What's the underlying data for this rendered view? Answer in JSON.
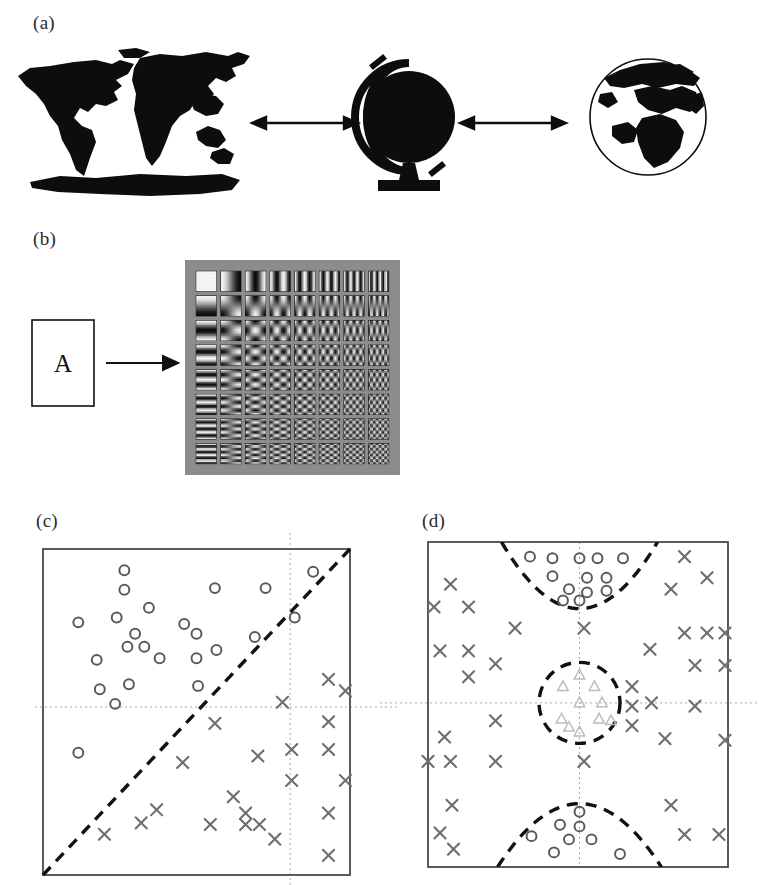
{
  "figure": {
    "background": "#ffffff",
    "ink": "#111111",
    "marker_gray": "#6e6e6e",
    "triangle_gray": "#b9b9b9",
    "grid_gray": "#aaaaaa",
    "dct_background": "#8c8c8c"
  },
  "panels": [
    {
      "id": "a",
      "label": "(a)",
      "kind": "illustration",
      "caption_text": "(a)",
      "items": [
        {
          "name": "world-map",
          "description": "flat world map silhouette with Antarctica strip"
        },
        {
          "name": "globe-on-stand",
          "description": "solid black globe with meridian ring and pedestal stand"
        },
        {
          "name": "earth-sphere",
          "description": "spherical Earth view centred on Europe and Africa"
        },
        {
          "name": "arrow-left",
          "description": "double-headed arrow between map and globe"
        },
        {
          "name": "arrow-right",
          "description": "double-headed arrow between globe and sphere"
        }
      ]
    },
    {
      "id": "b",
      "label": "(b)",
      "kind": "illustration",
      "source_symbol": "A",
      "items": [
        {
          "name": "letter-box",
          "description": "thin rectangle containing the letter A"
        },
        {
          "name": "transform-arrow",
          "description": "single-headed arrow pointing right"
        },
        {
          "name": "dct-basis-grid",
          "description": "8 by 8 grid of discrete cosine transform basis patches on grey field",
          "rows": 8,
          "cols": 8
        }
      ]
    },
    {
      "id": "c",
      "label": "(c)",
      "kind": "scatter"
    },
    {
      "id": "d",
      "label": "(d)",
      "kind": "scatter"
    }
  ],
  "chart_data": [
    {
      "panel": "c",
      "type": "scatter",
      "title": "(c)",
      "xlabel": "",
      "ylabel": "",
      "xlim": [
        0,
        1
      ],
      "ylim": [
        0,
        1
      ],
      "grid": true,
      "gridlines": {
        "vertical_x": 0.805,
        "horizontal_y": 0.515
      },
      "boundaries": [
        {
          "name": "linear-decision-boundary",
          "style": "dashed",
          "shape": "line",
          "from": [
            0.0,
            0.0
          ],
          "to": [
            1.0,
            1.0
          ]
        }
      ],
      "series": [
        {
          "name": "class-circle",
          "marker": "o",
          "color": "#5a5a5a",
          "points": [
            [
              0.265,
              0.935
            ],
            [
              0.265,
              0.875
            ],
            [
              0.345,
              0.82
            ],
            [
              0.56,
              0.88
            ],
            [
              0.725,
              0.88
            ],
            [
              0.88,
              0.93
            ],
            [
              0.115,
              0.775
            ],
            [
              0.24,
              0.79
            ],
            [
              0.3,
              0.74
            ],
            [
              0.46,
              0.77
            ],
            [
              0.82,
              0.79
            ],
            [
              0.275,
              0.7
            ],
            [
              0.33,
              0.7
            ],
            [
              0.5,
              0.74
            ],
            [
              0.69,
              0.73
            ],
            [
              0.175,
              0.66
            ],
            [
              0.38,
              0.665
            ],
            [
              0.5,
              0.665
            ],
            [
              0.565,
              0.69
            ],
            [
              0.185,
              0.57
            ],
            [
              0.28,
              0.585
            ],
            [
              0.505,
              0.58
            ],
            [
              0.235,
              0.525
            ],
            [
              0.115,
              0.375
            ]
          ]
        },
        {
          "name": "class-cross",
          "marker": "x",
          "color": "#6e6e6e",
          "points": [
            [
              0.93,
              0.6
            ],
            [
              0.985,
              0.565
            ],
            [
              0.78,
              0.53
            ],
            [
              0.93,
              0.47
            ],
            [
              0.56,
              0.465
            ],
            [
              0.81,
              0.385
            ],
            [
              0.93,
              0.385
            ],
            [
              0.7,
              0.365
            ],
            [
              0.455,
              0.345
            ],
            [
              0.81,
              0.29
            ],
            [
              0.985,
              0.29
            ],
            [
              0.62,
              0.24
            ],
            [
              0.93,
              0.19
            ],
            [
              0.37,
              0.2
            ],
            [
              0.66,
              0.19
            ],
            [
              0.32,
              0.16
            ],
            [
              0.545,
              0.155
            ],
            [
              0.66,
              0.155
            ],
            [
              0.705,
              0.155
            ],
            [
              0.2,
              0.125
            ],
            [
              0.755,
              0.11
            ],
            [
              0.93,
              0.06
            ]
          ]
        }
      ]
    },
    {
      "panel": "d",
      "type": "scatter",
      "title": "(d)",
      "xlabel": "",
      "ylabel": "",
      "xlim": [
        0,
        1
      ],
      "ylim": [
        0,
        1
      ],
      "grid": true,
      "gridlines": {
        "vertical_x": 0.505,
        "horizontal_y": 0.505
      },
      "boundaries": [
        {
          "name": "upper-parabola-boundary",
          "style": "dashed",
          "shape": "parabola-opening-up",
          "vertex": [
            0.505,
            0.795
          ],
          "half_width": 0.2,
          "top_y": 1.0
        },
        {
          "name": "centre-circle-boundary",
          "style": "dashed",
          "shape": "circle",
          "centre": [
            0.505,
            0.505
          ],
          "radius": 0.135
        },
        {
          "name": "lower-arch-boundary",
          "style": "dashed",
          "shape": "parabola-opening-down",
          "vertex": [
            0.505,
            0.195
          ],
          "half_width": 0.21,
          "bottom_y": 0.0
        }
      ],
      "series": [
        {
          "name": "class-circle",
          "marker": "o",
          "color": "#5a5a5a",
          "points": [
            [
              0.34,
              0.955
            ],
            [
              0.415,
              0.95
            ],
            [
              0.505,
              0.95
            ],
            [
              0.565,
              0.95
            ],
            [
              0.65,
              0.95
            ],
            [
              0.415,
              0.895
            ],
            [
              0.53,
              0.89
            ],
            [
              0.595,
              0.89
            ],
            [
              0.47,
              0.855
            ],
            [
              0.53,
              0.845
            ],
            [
              0.595,
              0.85
            ],
            [
              0.45,
              0.82
            ],
            [
              0.505,
              0.82
            ],
            [
              0.505,
              0.17
            ],
            [
              0.44,
              0.13
            ],
            [
              0.505,
              0.125
            ],
            [
              0.345,
              0.095
            ],
            [
              0.47,
              0.085
            ],
            [
              0.545,
              0.085
            ],
            [
              0.42,
              0.045
            ],
            [
              0.64,
              0.04
            ]
          ]
        },
        {
          "name": "class-triangle",
          "marker": "^",
          "color": "#bdbdbd",
          "points": [
            [
              0.505,
              0.59
            ],
            [
              0.45,
              0.555
            ],
            [
              0.555,
              0.555
            ],
            [
              0.505,
              0.505
            ],
            [
              0.58,
              0.505
            ],
            [
              0.445,
              0.455
            ],
            [
              0.57,
              0.455
            ],
            [
              0.61,
              0.45
            ],
            [
              0.47,
              0.43
            ],
            [
              0.505,
              0.415
            ]
          ]
        },
        {
          "name": "class-cross",
          "marker": "x",
          "color": "#6e6e6e",
          "points": [
            [
              0.855,
              0.955
            ],
            [
              0.075,
              0.87
            ],
            [
              0.93,
              0.89
            ],
            [
              0.81,
              0.855
            ],
            [
              0.02,
              0.8
            ],
            [
              0.135,
              0.8
            ],
            [
              0.29,
              0.735
            ],
            [
              0.52,
              0.735
            ],
            [
              0.855,
              0.72
            ],
            [
              0.93,
              0.72
            ],
            [
              0.99,
              0.72
            ],
            [
              0.04,
              0.665
            ],
            [
              0.135,
              0.665
            ],
            [
              0.74,
              0.67
            ],
            [
              0.225,
              0.625
            ],
            [
              0.89,
              0.62
            ],
            [
              0.99,
              0.62
            ],
            [
              0.135,
              0.585
            ],
            [
              0.68,
              0.555
            ],
            [
              0.745,
              0.505
            ],
            [
              0.68,
              0.495
            ],
            [
              0.225,
              0.45
            ],
            [
              0.89,
              0.495
            ],
            [
              0.68,
              0.435
            ],
            [
              0.055,
              0.4
            ],
            [
              0.79,
              0.395
            ],
            [
              0.99,
              0.39
            ],
            [
              0.0,
              0.325
            ],
            [
              0.075,
              0.325
            ],
            [
              0.225,
              0.325
            ],
            [
              0.52,
              0.325
            ],
            [
              0.08,
              0.19
            ],
            [
              0.81,
              0.19
            ],
            [
              0.04,
              0.105
            ],
            [
              0.855,
              0.1
            ],
            [
              0.97,
              0.1
            ],
            [
              0.085,
              0.055
            ]
          ]
        }
      ]
    }
  ]
}
